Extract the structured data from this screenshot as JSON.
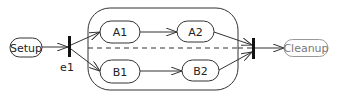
{
  "diagram": {
    "type": "activity-diagram",
    "nodes": {
      "setup": {
        "label": "Setup"
      },
      "a1": {
        "label": "A1"
      },
      "a2": {
        "label": "A2"
      },
      "b1": {
        "label": "B1"
      },
      "b2": {
        "label": "B2"
      },
      "cleanup": {
        "label": "Cleanup"
      }
    },
    "fork": {
      "label": "e1"
    },
    "edges": [
      {
        "from": "setup",
        "to": "fork"
      },
      {
        "from": "fork",
        "to": "a1"
      },
      {
        "from": "fork",
        "to": "b1"
      },
      {
        "from": "a1",
        "to": "a2"
      },
      {
        "from": "b1",
        "to": "b2"
      },
      {
        "from": "a2",
        "to": "join"
      },
      {
        "from": "b2",
        "to": "join"
      },
      {
        "from": "region",
        "to": "join"
      },
      {
        "from": "join",
        "to": "cleanup"
      }
    ],
    "colors": {
      "stroke": "#333333",
      "muted": "#888888",
      "background": "#ffffff"
    }
  }
}
